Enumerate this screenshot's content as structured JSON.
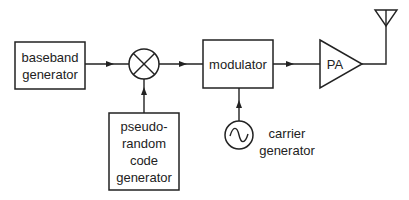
{
  "diagram": {
    "type": "block-diagram",
    "nodes": {
      "baseband": {
        "lines": [
          "baseband",
          "generator"
        ]
      },
      "mixer": {
        "symbol": "multiplier-circle"
      },
      "pn": {
        "lines": [
          "pseudo-",
          "random",
          "code",
          "generator"
        ]
      },
      "modulator": {
        "lines": [
          "modulator"
        ]
      },
      "carrier": {
        "lines": [
          "carrier",
          "generator"
        ],
        "symbol": "sine-oscillator"
      },
      "pa": {
        "lines": [
          "PA"
        ]
      },
      "antenna": {
        "symbol": "antenna"
      }
    },
    "edges": [
      {
        "from": "baseband",
        "to": "mixer"
      },
      {
        "from": "pn",
        "to": "mixer"
      },
      {
        "from": "mixer",
        "to": "modulator"
      },
      {
        "from": "carrier",
        "to": "modulator"
      },
      {
        "from": "modulator",
        "to": "pa"
      },
      {
        "from": "pa",
        "to": "antenna"
      }
    ]
  }
}
